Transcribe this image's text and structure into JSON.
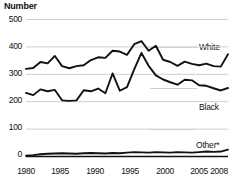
{
  "chart_data": {
    "type": "line",
    "title": "Number",
    "xlabel": "",
    "ylabel": "Number",
    "ylim": [
      0,
      500
    ],
    "xlim": [
      1980,
      2008
    ],
    "yticks": [
      "0",
      "100",
      "200",
      "300",
      "400",
      "500"
    ],
    "ytick_values": [
      0,
      100,
      200,
      300,
      400,
      500
    ],
    "xticks": [
      "1980",
      "1985",
      "1990",
      "1995",
      "2000",
      "2005",
      "2008"
    ],
    "xtick_values": [
      1980,
      1985,
      1990,
      1995,
      2000,
      2005,
      2008
    ],
    "grid": true,
    "legend_position": "inline-right",
    "x": [
      1980,
      1981,
      1982,
      1983,
      1984,
      1985,
      1986,
      1987,
      1988,
      1989,
      1990,
      1991,
      1992,
      1993,
      1994,
      1995,
      1996,
      1997,
      1998,
      1999,
      2000,
      2001,
      2002,
      2003,
      2004,
      2005,
      2006,
      2007,
      2008
    ],
    "series": [
      {
        "name": "White",
        "color": "#111111",
        "values": [
          320,
          323,
          345,
          340,
          367,
          330,
          322,
          330,
          333,
          352,
          362,
          360,
          386,
          383,
          371,
          410,
          421,
          386,
          404,
          353,
          345,
          331,
          346,
          338,
          333,
          339,
          330,
          328,
          373
        ]
      },
      {
        "name": "Black",
        "color": "#111111",
        "values": [
          232,
          224,
          245,
          238,
          243,
          205,
          203,
          205,
          242,
          238,
          248,
          231,
          303,
          240,
          253,
          318,
          378,
          331,
          296,
          281,
          271,
          262,
          280,
          278,
          260,
          258,
          249,
          241,
          250
        ]
      },
      {
        "name": "Other*",
        "color": "#111111",
        "values": [
          3,
          5,
          8,
          10,
          11,
          12,
          11,
          10,
          12,
          13,
          12,
          11,
          13,
          12,
          14,
          16,
          15,
          14,
          16,
          15,
          14,
          16,
          15,
          14,
          16,
          18,
          17,
          18,
          25
        ]
      }
    ]
  },
  "labels": {
    "white": "White",
    "black": "Black",
    "other": "Other*"
  }
}
